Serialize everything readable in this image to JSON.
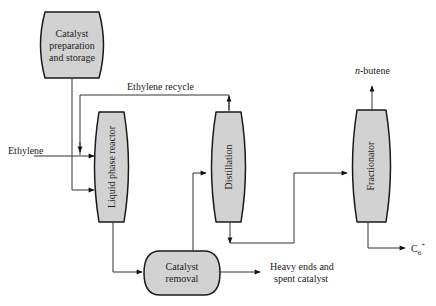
{
  "diagram": {
    "colors": {
      "box_fill": "#d2d2d2",
      "stroke": "#1a1a1a",
      "line": "#333333",
      "background": "#ffffff"
    },
    "units": {
      "catalyst_prep": {
        "lines": [
          "Catalyst",
          "preparation",
          "and storage"
        ]
      },
      "reactor": {
        "label": "Liquid phase reactor"
      },
      "distillation": {
        "label": "Distillation"
      },
      "fractionator": {
        "label": "Fractionator"
      },
      "catalyst_removal": {
        "lines": [
          "Catalyst",
          "removal"
        ]
      }
    },
    "streams": {
      "ethylene_feed": "Ethylene",
      "ethylene_recycle": "Ethylene recycle",
      "n_butene": "n-butene",
      "n_butene_italic": "n",
      "n_butene_rest": "-butene",
      "c6_plus": "C",
      "c6_sub": "6",
      "c6_sup": "+",
      "heavy_ends": [
        "Heavy ends and",
        "spent  catalyst"
      ]
    }
  }
}
